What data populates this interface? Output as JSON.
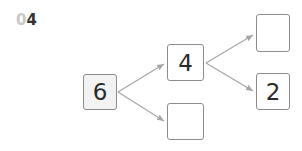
{
  "problem": {
    "number_prefix": "0",
    "number_main": "4"
  },
  "tree": {
    "root": {
      "value": "6"
    },
    "level1": [
      {
        "value": "4"
      },
      {
        "value": ""
      }
    ],
    "level2": [
      {
        "value": ""
      },
      {
        "value": "2"
      }
    ]
  },
  "colors": {
    "border": "#8c8c8c",
    "arrow": "#a6a6a6",
    "root_fill": "#f2f2f2"
  }
}
